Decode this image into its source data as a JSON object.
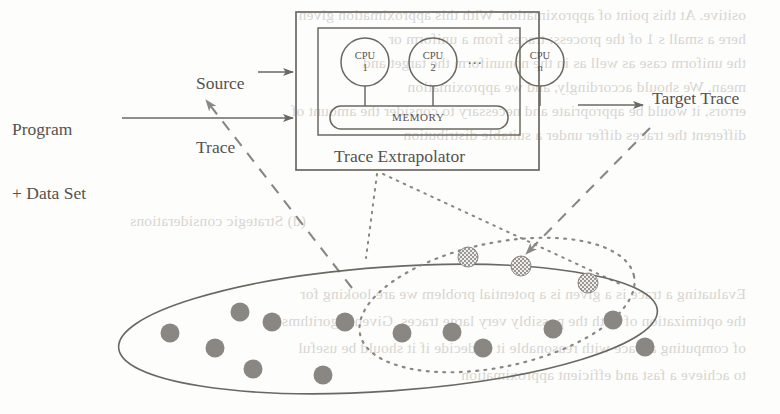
{
  "figure": {
    "title": "Trace Extrapolator",
    "labels": {
      "source_trace_line1": "Source",
      "source_trace_line2": "Trace",
      "program_line1": "Program",
      "program_line2": "+ Data Set",
      "target_trace": "Target Trace",
      "trace_extrapolator": "Trace Extrapolator",
      "memory": "MEMORY",
      "ellipsis": "..."
    },
    "cpus": [
      {
        "name": "CPU",
        "index": "1",
        "cx": 365,
        "cy": 62,
        "r": 24
      },
      {
        "name": "CPU",
        "index": "2",
        "cx": 433,
        "cy": 62,
        "r": 24
      },
      {
        "name": "CPU",
        "index": "n",
        "cx": 540,
        "cy": 62,
        "r": 24
      }
    ],
    "ellipsis_position": {
      "x": 476,
      "y": 58
    },
    "boxes": {
      "outer": {
        "x": 296,
        "y": 12,
        "w": 243,
        "h": 158
      },
      "inner": {
        "x": 318,
        "y": 28,
        "w": 202,
        "h": 107
      },
      "memory": {
        "x": 330,
        "y": 106,
        "w": 178,
        "h": 23,
        "rx": 11
      }
    },
    "arrows": [
      {
        "name": "source-trace-arrow",
        "x1": 258,
        "y1": 72,
        "x2": 294,
        "y2": 72,
        "style": "solid"
      },
      {
        "name": "program-data-arrow",
        "x1": 122,
        "y1": 118,
        "x2": 294,
        "y2": 118,
        "style": "solid"
      },
      {
        "name": "target-trace-arrow",
        "x1": 578,
        "y1": 105,
        "x2": 644,
        "y2": 105,
        "style": "solid"
      },
      {
        "name": "source-sample-dashed-arrow",
        "x1": 350,
        "y1": 285,
        "x2": 204,
        "y2": 98,
        "style": "dashed"
      },
      {
        "name": "target-sample-dashed-arrow",
        "x1": 648,
        "y1": 128,
        "x2": 524,
        "y2": 255,
        "style": "dashed"
      }
    ],
    "dotted_connectors": [
      {
        "name": "extrapolator-to-target-set-left",
        "x1": 376,
        "y1": 176,
        "x2": 372,
        "y2": 252
      },
      {
        "name": "extrapolator-to-target-set-right",
        "x1": 382,
        "y1": 176,
        "x2": 616,
        "y2": 280
      }
    ],
    "source_set": {
      "name": "source-trace-population",
      "style": "solid-ellipse",
      "cx": 388,
      "cy": 329,
      "rx": 270,
      "ry": 62,
      "rotation": -4,
      "points": [
        {
          "x": 170,
          "y": 333
        },
        "",
        {
          "x": 215,
          "y": 348
        },
        {
          "x": 240,
          "y": 314
        },
        {
          "x": 253,
          "y": 369
        },
        {
          "x": 270,
          "y": 322
        },
        {
          "x": 323,
          "y": 375
        },
        {
          "x": 345,
          "y": 322
        },
        {
          "x": 402,
          "y": 333
        },
        {
          "x": 452,
          "y": 332
        },
        {
          "x": 483,
          "y": 348
        },
        {
          "x": 553,
          "y": 329
        },
        {
          "x": 613,
          "y": 320
        },
        {
          "x": 645,
          "y": 347
        }
      ]
    },
    "target_set": {
      "name": "target-trace-population",
      "style": "dotted-ellipse",
      "cx": 497,
      "cy": 305,
      "rx": 140,
      "ry": 62,
      "rotation": -12,
      "points": [
        {
          "x": 468,
          "y": 257
        },
        {
          "x": 521,
          "y": 265
        },
        {
          "x": 588,
          "y": 283
        }
      ]
    },
    "colors": {
      "ink": "#6b6862",
      "dot_fill": "#8a8783",
      "hatch_fill": "#a8a5a0",
      "bleed_text": "#b9b5ae",
      "page_bg": "#fdfdfc"
    }
  },
  "background_bleed_text": [
    "ositive. At this point of approximation.  With this approximation given",
    "here a small s  1 of the process: traces from a uniform or",
    "the uniform case as well as in the nonuniform  the target and",
    "mean. We should accordingly, and we  approximation",
    "errors, it would be appropriate and necessary to consider the amount of",
    "different the traces differ under a suitable  distribution",
    "(d)  Strategic considerations",
    "Evaluating a trace is a given is a potential problem we are looking for",
    "the optimization of both the possibly very large traces. Given algorithms",
    "of computing a trace with reasonable it to decide if it should be useful",
    "to achieve a fast and efficient approximation"
  ]
}
